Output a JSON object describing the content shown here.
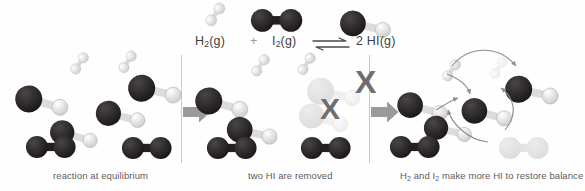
{
  "figure": {
    "title_equation": {
      "reactant1": "H",
      "reactant1_sub": "2",
      "reactant1_state": "(g)",
      "plus": "+",
      "reactant2": "I",
      "reactant2_sub": "2",
      "reactant2_state": "(g)",
      "arrow": "⇌",
      "product_coeff": "2 ",
      "product": "HI",
      "product_state": "(g)",
      "full_text": "H2(g) + I2(g) ⇌ 2 HI(g)"
    },
    "colors": {
      "iodine_atom": "#231f20",
      "hydrogen_atom": "#f2f2f2",
      "bond_dark": "#231f20",
      "bond_light": "#d8d8d8",
      "block_arrow": "#9a9a9c",
      "x_mark": "#6e6e70",
      "faded_molecule": "#e3e3e3",
      "caption_text": "#5d5d5f",
      "divider": "#c9c9c9",
      "background": "#ffffff"
    },
    "panels": [
      {
        "id": "panel-equilibrium",
        "caption": "reaction at equilibrium",
        "caption_x": 53,
        "caption_y": 170,
        "species_counts": {
          "H2": 2,
          "I2": 2,
          "HI": 4
        },
        "molecules": [
          {
            "type": "H2",
            "x": 65,
            "y": 61,
            "rot": -28,
            "scale": 0.52,
            "faded": false
          },
          {
            "type": "H2",
            "x": 113,
            "y": 60,
            "rot": -30,
            "scale": 0.52,
            "faded": false
          },
          {
            "type": "HI",
            "x": 16,
            "y": 82,
            "rot": 8,
            "scale": 1.0,
            "faded": false
          },
          {
            "type": "HI",
            "x": 96,
            "y": 98,
            "rot": 6,
            "scale": 0.93,
            "faded": false
          },
          {
            "type": "HI",
            "x": 128,
            "y": 72,
            "rot": 5,
            "scale": 1.0,
            "faded": false
          },
          {
            "type": "HI",
            "x": 51,
            "y": 117,
            "rot": 9,
            "scale": 0.9,
            "faded": false
          },
          {
            "type": "I2",
            "x": 25,
            "y": 135,
            "rot": 0,
            "scale": 0.92,
            "faded": false
          },
          {
            "type": "I2",
            "x": 121,
            "y": 136,
            "rot": 0,
            "scale": 0.92,
            "faded": false
          }
        ]
      },
      {
        "id": "panel-removed",
        "caption": "two HI are removed",
        "caption_x": 248,
        "caption_y": 170,
        "species_counts": {
          "H2": 2,
          "I2": 2,
          "HI": 2,
          "HI_removed": 2
        },
        "x_marks": [
          {
            "x": 320,
            "y": 94,
            "size": 30
          },
          {
            "x": 355,
            "y": 66,
            "size": 32
          }
        ],
        "molecules": [
          {
            "type": "H2",
            "x": 246,
            "y": 63,
            "rot": -28,
            "scale": 0.52,
            "faded": false
          },
          {
            "type": "H2",
            "x": 292,
            "y": 62,
            "rot": -30,
            "scale": 0.52,
            "faded": false
          },
          {
            "type": "HI",
            "x": 196,
            "y": 84,
            "rot": 8,
            "scale": 1.0,
            "faded": false
          },
          {
            "type": "HI",
            "x": 227,
            "y": 114,
            "rot": 6,
            "scale": 0.95,
            "faded": false
          },
          {
            "type": "HI",
            "x": 307,
            "y": 75,
            "rot": 5,
            "scale": 1.0,
            "faded": true
          },
          {
            "type": "HI",
            "x": 300,
            "y": 100,
            "rot": 9,
            "scale": 0.93,
            "faded": true
          },
          {
            "type": "I2",
            "x": 206,
            "y": 136,
            "rot": 0,
            "scale": 0.92,
            "faded": false
          },
          {
            "type": "I2",
            "x": 300,
            "y": 136,
            "rot": 0,
            "scale": 0.92,
            "faded": false
          }
        ]
      },
      {
        "id": "panel-restore",
        "caption": "H2 and I2 make more HI to restore balance",
        "caption_parts": [
          "H",
          "2",
          " and I",
          "2",
          " make more HI to restore balance"
        ],
        "caption_x": 400,
        "caption_y": 170,
        "species_counts": {
          "H2": 1,
          "I2": 1,
          "HI": 4,
          "I2_consumed": 1
        },
        "molecules": [
          {
            "type": "H2",
            "x": 437,
            "y": 68,
            "rot": -28,
            "scale": 0.52,
            "faded": false
          },
          {
            "type": "H2",
            "x": 484,
            "y": 66,
            "rot": -30,
            "scale": 0.52,
            "faded": true
          },
          {
            "type": "HI",
            "x": 398,
            "y": 89,
            "rot": 8,
            "scale": 0.95,
            "faded": false
          },
          {
            "type": "HI",
            "x": 424,
            "y": 113,
            "rot": 6,
            "scale": 0.9,
            "faded": false
          },
          {
            "type": "HI",
            "x": 505,
            "y": 73,
            "rot": 5,
            "scale": 1.0,
            "faded": false
          },
          {
            "type": "HI",
            "x": 462,
            "y": 95,
            "rot": 7,
            "scale": 0.95,
            "faded": false
          },
          {
            "type": "I2",
            "x": 389,
            "y": 135,
            "rot": 0,
            "scale": 0.92,
            "faded": false
          },
          {
            "type": "I2",
            "x": 498,
            "y": 136,
            "rot": 0,
            "scale": 0.92,
            "faded": true
          }
        ]
      }
    ],
    "legend_molecules": [
      {
        "type": "H2",
        "x": 200,
        "y": 12,
        "scale": 0.55,
        "rot": -28,
        "label": "H2-legend"
      },
      {
        "type": "I2",
        "x": 250,
        "y": 8,
        "scale": 0.95,
        "rot": 0,
        "label": "I2-legend"
      },
      {
        "type": "HI",
        "x": 340,
        "y": 8,
        "scale": 0.95,
        "rot": 5,
        "label": "HI-legend"
      }
    ],
    "block_arrows": [
      {
        "id": "arrow-panel1-to-panel2",
        "x": 183,
        "y": 101,
        "w": 28,
        "h": 22
      },
      {
        "id": "arrow-panel2-to-panel3",
        "x": 371,
        "y": 101,
        "w": 28,
        "h": 22
      }
    ],
    "dividers": [
      {
        "x": 181,
        "y": 55,
        "h": 108
      },
      {
        "x": 369,
        "y": 55,
        "h": 108
      }
    ],
    "reaction_arrows": [
      {
        "id": "h2-to-hi-upper",
        "d": "M 452 66 C 470 44 500 46 516 66"
      },
      {
        "id": "i2-to-hi-upper",
        "d": "M 505 130 C 520 112 512 96 501 88"
      },
      {
        "id": "h2-to-hi-mid",
        "d": "M 447 74 C 462 80 468 86 470 94"
      },
      {
        "id": "i2-to-hi-mid",
        "d": "M 488 142 C 468 140 452 124 448 110"
      },
      {
        "id": "hi-feedback",
        "d": "M 436 110 C 446 104 452 100 458 98"
      }
    ]
  }
}
